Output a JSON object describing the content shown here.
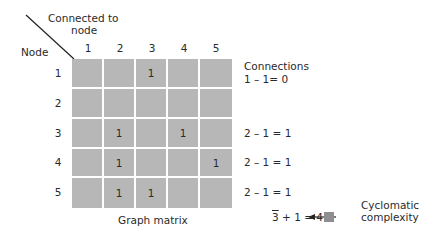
{
  "diagram": {
    "corner": {
      "column_axis_label_line1": "Connected to",
      "column_axis_label_line2": "node",
      "row_axis_label": "Node"
    },
    "columns": [
      "1",
      "2",
      "3",
      "4",
      "5"
    ],
    "rows": [
      "1",
      "2",
      "3",
      "4",
      "5"
    ],
    "matrix": [
      [
        "",
        "",
        "1",
        "",
        ""
      ],
      [
        "",
        "",
        "",
        "",
        ""
      ],
      [
        "",
        "1",
        "",
        "1",
        ""
      ],
      [
        "",
        "1",
        "",
        "",
        "1"
      ],
      [
        "",
        "1",
        "1",
        "",
        ""
      ]
    ],
    "caption": "Graph matrix",
    "connections_header": "Connections",
    "connections": [
      {
        "row": "1",
        "expr": "1 – 1= 0"
      },
      {
        "row": "2",
        "expr": ""
      },
      {
        "row": "3",
        "expr": "2 – 1 = 1"
      },
      {
        "row": "4",
        "expr": "2 – 1 = 1"
      },
      {
        "row": "5",
        "expr": "2 – 1 = 1"
      }
    ],
    "sum": {
      "total": "3",
      "rest": " + 1 = 4"
    },
    "result_label_line1": "Cyclomatic",
    "result_label_line2": "complexity",
    "colors": {
      "cell": "#b7b7b7",
      "grid_line": "#ffffff",
      "swatch": "#8e8e8e",
      "text": "#2a2a2a"
    }
  }
}
